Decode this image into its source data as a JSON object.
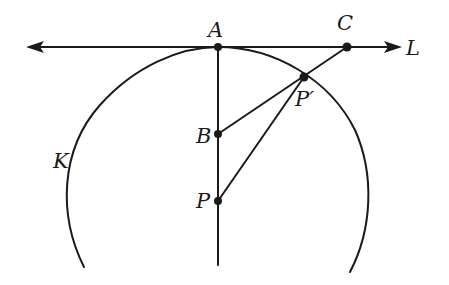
{
  "diagram": {
    "type": "geometry",
    "colors": {
      "ink": "#1a1a1a",
      "background": "#ffffff"
    },
    "labels": {
      "A": "A",
      "C": "C",
      "L": "L",
      "P_prime": "P′",
      "B": "B",
      "K": "K",
      "P": "P"
    },
    "points": {
      "A": [
        218,
        47
      ],
      "C": [
        347,
        47
      ],
      "P_prime": [
        304,
        77
      ],
      "B": [
        218,
        134
      ],
      "P": [
        218,
        201
      ]
    }
  }
}
